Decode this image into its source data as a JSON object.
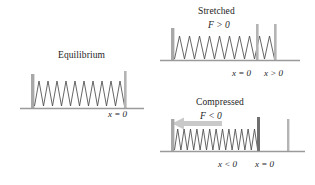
{
  "figure": {
    "background": "#ffffff",
    "ink": "#1d1d1d",
    "spring_color": "#4a4a4a",
    "bar_color": "#a8a8a8",
    "ground_color": "#9a9a9a",
    "arrow_color": "#c9c9c9"
  },
  "panels": [
    {
      "id": "equilibrium",
      "caption": "Equilibrium",
      "force_label": "",
      "position_labels": [
        "x = 0"
      ],
      "spring_state": "relaxed",
      "coils": 11,
      "arrow": "none"
    },
    {
      "id": "stretched",
      "caption": "Stretched",
      "force_label": "F > 0",
      "position_labels": [
        "x = 0",
        "x > 0"
      ],
      "spring_state": "stretched",
      "coils": 11,
      "arrow": "none"
    },
    {
      "id": "compressed",
      "caption": "Compressed",
      "force_label": "F < 0",
      "position_labels": [
        "x < 0",
        "x = 0"
      ],
      "spring_state": "compressed",
      "coils": 14,
      "arrow": "left"
    }
  ]
}
